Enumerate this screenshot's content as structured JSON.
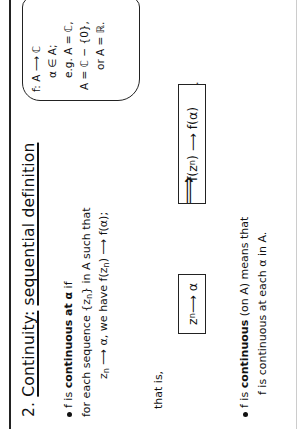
{
  "slide": {
    "section_number": "2.",
    "title_main": "Continuity:",
    "title_underlined": "sequential definition",
    "note_cloud": {
      "lines": [
        "f: A ⟶ ℂ",
        "α ∈ A;",
        "e.g. A = ℂ,",
        "A = ℂ − {0},",
        "or A = ℝ."
      ]
    },
    "def1": {
      "prefix": "f is ",
      "bold": "continuous at α",
      "suffix": " if",
      "line2_pre": "for each sequence {z",
      "line2_sub": "n",
      "line2_post": "} in A such that",
      "line3_a": "z",
      "line3_sub": "n",
      "line3_b": " ⟶ α,   we have f(z",
      "line3_sub2": "n",
      "line3_c": ") ⟶ f(α);"
    },
    "that_is": "that is,",
    "box_left": {
      "a": "z",
      "sub": "n",
      "b": " ⟶ α"
    },
    "implies_symbol": "⟹",
    "box_right": {
      "a": "f(z",
      "sub": "n",
      "b": ") ⟶ f(α)"
    },
    "box_right_period": ".",
    "def2": {
      "prefix": "f is ",
      "bold": "continuous",
      "mid": " (on A) means that",
      "line2": "f is continuous at each α in A."
    }
  }
}
